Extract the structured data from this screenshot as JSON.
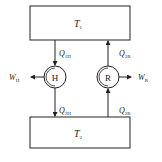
{
  "diagram": {
    "type": "heat engine and refrigerator between two reservoirs",
    "reservoirs": [
      {
        "id": "hot",
        "label": "T",
        "subscript": "1"
      },
      {
        "id": "cold",
        "label": "T",
        "subscript": "2"
      }
    ],
    "devices": [
      {
        "id": "engine",
        "label": "H"
      },
      {
        "id": "refrigerator",
        "label": "R"
      }
    ],
    "flows": [
      {
        "id": "q1h",
        "label": "Q",
        "subscript": "1H",
        "from": "hot",
        "to": "engine"
      },
      {
        "id": "q2h",
        "label": "Q",
        "subscript": "2H",
        "from": "engine",
        "to": "cold"
      },
      {
        "id": "wh",
        "label": "W",
        "subscript": "H",
        "from": "engine",
        "to": "out-left"
      },
      {
        "id": "q2r",
        "label": "Q",
        "subscript": "2R",
        "from": "cold",
        "to": "refrigerator"
      },
      {
        "id": "q1r",
        "label": "Q",
        "subscript": "1R",
        "from": "refrigerator",
        "to": "hot"
      },
      {
        "id": "wr",
        "label": "W",
        "subscript": "R",
        "from": "refrigerator",
        "to": "out-right"
      }
    ],
    "colors": {
      "stroke": "#222222",
      "background": "#ffffff"
    }
  }
}
